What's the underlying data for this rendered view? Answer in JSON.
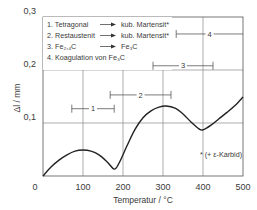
{
  "chart_data": {
    "type": "line",
    "title": "",
    "xlabel": "Temperatur  /  °C",
    "ylabel": "Δl  /  mm",
    "xlim": [
      0,
      500
    ],
    "ylim": [
      0,
      0.3
    ],
    "grid": true,
    "x_ticks": [
      {
        "value": 0,
        "label": "0"
      },
      {
        "value": 100,
        "label": "100"
      },
      {
        "value": 200,
        "label": "200"
      },
      {
        "value": 300,
        "label": "300"
      },
      {
        "value": 400,
        "label": "400"
      },
      {
        "value": 500,
        "label": "500"
      }
    ],
    "y_ticks": [
      {
        "value": 0.1,
        "label": "0,1"
      },
      {
        "value": 0.2,
        "label": "0,2"
      },
      {
        "value": 0.3,
        "label": "0,3"
      }
    ],
    "series": [
      {
        "name": "Δl",
        "x": [
          0,
          20,
          40,
          60,
          80,
          100,
          120,
          140,
          160,
          178,
          190,
          210,
          230,
          250,
          270,
          290,
          308,
          330,
          350,
          370,
          390,
          400,
          420,
          440,
          460,
          480,
          500
        ],
        "y": [
          0,
          0.017,
          0.03,
          0.04,
          0.047,
          0.049,
          0.047,
          0.04,
          0.027,
          0.013,
          0.024,
          0.057,
          0.088,
          0.11,
          0.123,
          0.13,
          0.132,
          0.128,
          0.117,
          0.102,
          0.089,
          0.087,
          0.096,
          0.108,
          0.12,
          0.133,
          0.149
        ]
      }
    ],
    "legend": {
      "position": "top-left",
      "entries": [
        {
          "num": "1.",
          "from": "Tetragonal",
          "arrow": true,
          "to": "kub. Martensit*"
        },
        {
          "num": "2.",
          "from": "Restaustenit",
          "arrow": true,
          "to": "kub. Martensit*"
        },
        {
          "num": "3.",
          "from": "Fe2,4C",
          "arrow": true,
          "to": "Fe3C"
        },
        {
          "num": "4.",
          "from": "Koagulation von Fe3C",
          "arrow": false,
          "to": ""
        }
      ]
    },
    "ranges": [
      {
        "label": "1",
        "x_start": 72,
        "x_end": 178,
        "y": 0.127
      },
      {
        "label": "2",
        "x_start": 168,
        "x_end": 320,
        "y": 0.153
      },
      {
        "label": "3",
        "x_start": 275,
        "x_end": 425,
        "y": 0.208
      },
      {
        "label": "4",
        "x_start": 333,
        "x_end": 500,
        "y": 0.268
      }
    ],
    "annotations": [
      {
        "text": "* (+ ε-Karbid)",
        "x": 445,
        "y": 0.035
      }
    ]
  }
}
